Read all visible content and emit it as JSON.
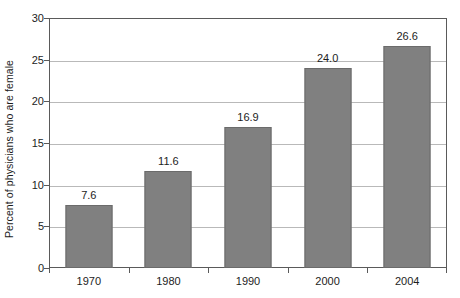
{
  "chart_data": {
    "type": "bar",
    "title": "",
    "subtitle": "",
    "xlabel": "",
    "ylabel": "Percent of physicians who are female",
    "categories": [
      "1970",
      "1980",
      "1990",
      "2000",
      "2004"
    ],
    "values": [
      7.6,
      11.6,
      16.9,
      24.0,
      26.6
    ],
    "data_labels": [
      "7.6",
      "11.6",
      "16.9",
      "24.0",
      "26.6"
    ],
    "ylim": [
      0,
      30
    ],
    "ytick_values": [
      0,
      5,
      10,
      15,
      20,
      25,
      30
    ],
    "ytick_labels": [
      "0",
      "5",
      "10",
      "15",
      "20",
      "25",
      "30"
    ],
    "grid": true,
    "grid_axis": "y",
    "legend": false,
    "legend_position": "none",
    "bar_color": "#808080",
    "bar_edge_color": "#6b6b6b",
    "gridline_color": "#b9b9b9",
    "axis_color": "#5a5a5a",
    "background_color": "#ffffff",
    "text_color": "#1d1d1d"
  }
}
